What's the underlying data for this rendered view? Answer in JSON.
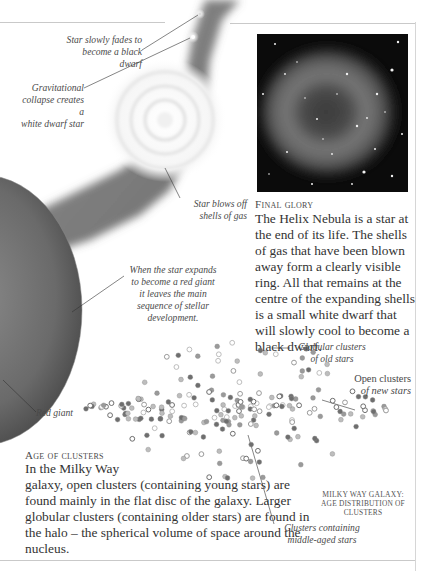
{
  "life_cycle": {
    "captions": {
      "black_dwarf": [
        "Star slowly fades to",
        "become a black dwarf"
      ],
      "white_dwarf": [
        "Gravitational",
        "collapse creates a",
        "white dwarf star"
      ],
      "shells": [
        "Star blows off",
        "shells of gas"
      ],
      "red_giant_expand": [
        "When the star expands",
        "to become a red giant",
        "it leaves the main",
        "sequence of stellar",
        "development."
      ],
      "red_giant": "Red giant"
    }
  },
  "final_glory": {
    "heading": "Final glory",
    "body": "The Helix Nebula is a star at the end of its life. The shells of gas that have been blown away form a clearly visible ring. All that remains at the centre of the expanding shells is a small white dwarf that will slowly cool to become a black dwarf.",
    "image_alt": "Helix Nebula photograph"
  },
  "age_of_clusters": {
    "heading": "Age of clusters",
    "body_first": "In the Milky Way",
    "body_rest": "galaxy, open clusters (containing young stars) are found mainly in the flat disc of the galaxy. Larger globular clusters (containing older stars) are found in the halo – the spherical volume of space around the nucleus."
  },
  "galaxy_figure": {
    "captions": {
      "globular": [
        "Globular clusters",
        "of old stars"
      ],
      "open": [
        "Open clusters",
        "of new stars"
      ],
      "middle": [
        "Clusters containing",
        "middle-aged stars"
      ]
    },
    "label": [
      "Milky Way Galaxy:",
      "Age distribution of",
      "clusters"
    ]
  },
  "colors": {
    "text": "#333333",
    "rule": "#c9c9c9",
    "dot_dark": "#6e6e6e",
    "dot_mid": "#9a9a9a",
    "dot_light": "#bdbdbd"
  }
}
